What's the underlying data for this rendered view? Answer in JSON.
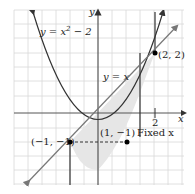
{
  "figure": {
    "curve_label": "y = x² − 2",
    "curve_label_parts": {
      "pre": "y = x",
      "sup": "2",
      "post": " − 2"
    },
    "line_label": "y = x",
    "x_axis_label": "x",
    "y_axis_label": "y",
    "x_tick_label": "2",
    "point_a_label": "(−1, −1)",
    "point_b_label": "(1, −1)",
    "point_c_label": "(2, 2)",
    "fixed_x_label": "Fixed x"
  },
  "colors": {
    "grid": "#d8d8d8",
    "axis": "#555555",
    "curve": "#333333",
    "line": "#777777",
    "shade": "#e6e6e6",
    "point": "#000000"
  }
}
